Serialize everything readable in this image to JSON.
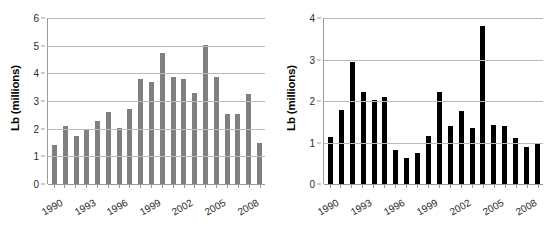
{
  "figure": {
    "background": "#ffffff",
    "panels": [
      "left",
      "right"
    ]
  },
  "chart_data": [
    {
      "id": "left-chart",
      "type": "bar",
      "title": "",
      "xlabel": "",
      "ylabel": "Lb (millions)",
      "ylim": [
        0,
        6
      ],
      "yticks": [
        0,
        1,
        2,
        3,
        4,
        5,
        6
      ],
      "grid": true,
      "legend": false,
      "bar_color": "#808080",
      "categories": [
        1989,
        1990,
        1991,
        1992,
        1993,
        1994,
        1995,
        1996,
        1997,
        1998,
        1999,
        2000,
        2001,
        2002,
        2003,
        2004,
        2005,
        2006,
        2007,
        2008
      ],
      "visible_tick_labels": [
        "1990",
        "1993",
        "1996",
        "1999",
        "2002",
        "2005",
        "2008"
      ],
      "visible_tick_indexes": [
        1,
        4,
        7,
        10,
        13,
        16,
        19
      ],
      "values": [
        1.42,
        2.1,
        1.72,
        1.95,
        2.27,
        2.62,
        2.01,
        2.72,
        3.79,
        3.68,
        4.74,
        3.87,
        3.79,
        3.28,
        5.04,
        3.88,
        2.53,
        2.52,
        3.26,
        1.48
      ]
    },
    {
      "id": "right-chart",
      "type": "bar",
      "title": "",
      "xlabel": "",
      "ylabel": "Lb (millions)",
      "ylim": [
        0,
        4
      ],
      "yticks": [
        0,
        1,
        2,
        3,
        4
      ],
      "grid": true,
      "legend": false,
      "bar_color": "#000000",
      "categories": [
        1989,
        1990,
        1991,
        1992,
        1993,
        1994,
        1995,
        1996,
        1997,
        1998,
        1999,
        2000,
        2001,
        2002,
        2003,
        2004,
        2005,
        2006,
        2007,
        2008
      ],
      "visible_tick_labels": [
        "1990",
        "1993",
        "1996",
        "1999",
        "2002",
        "2005",
        "2008"
      ],
      "visible_tick_indexes": [
        1,
        4,
        7,
        10,
        13,
        16,
        19
      ],
      "values": [
        1.13,
        1.78,
        2.95,
        2.22,
        2.03,
        2.09,
        0.83,
        0.62,
        0.75,
        1.15,
        2.22,
        1.4,
        1.75,
        1.35,
        3.8,
        1.42,
        1.4,
        1.11,
        0.88,
        0.98
      ]
    }
  ]
}
